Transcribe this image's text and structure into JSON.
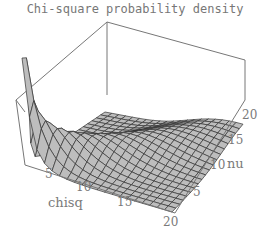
{
  "chart_data": {
    "type": "surface3d",
    "title": "Chi-square probability density",
    "xlabel": "chisq",
    "ylabel": "nu",
    "zlabel": "",
    "x_ticks": [
      "5",
      "10",
      "15",
      "20"
    ],
    "y_ticks": [
      "5",
      "10",
      "15",
      "20"
    ],
    "xlim": [
      0,
      20
    ],
    "ylim": [
      1,
      20
    ],
    "grid": true,
    "surface_color": "#bdbdbd",
    "mesh_color": "#333333",
    "box_color": "#777777"
  },
  "labels": {
    "title": "Chi-square probability density",
    "x_axis": "chisq",
    "y_axis": "nu",
    "x_ticks": [
      "5",
      "10",
      "15",
      "20"
    ],
    "y_ticks": [
      "5",
      "10",
      "15",
      "20"
    ]
  }
}
